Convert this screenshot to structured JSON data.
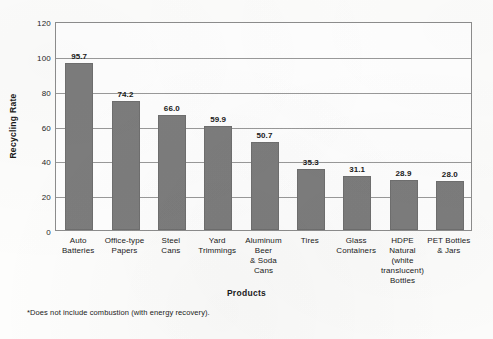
{
  "chart_data": {
    "type": "bar",
    "title": "",
    "xlabel": "Products",
    "ylabel": "Recycling Rate",
    "ylim": [
      0,
      120
    ],
    "yticks": [
      0,
      20,
      40,
      60,
      80,
      100,
      120
    ],
    "grid": true,
    "legend": false,
    "orientation": "vertical",
    "bar_color": "#7d7d7d",
    "categories": [
      "Auto Batteries",
      "Office-type Papers",
      "Steel Cans",
      "Yard Trimmings",
      "Aluminum Beer & Soda Cans",
      "Tires",
      "Glass Containers",
      "HDPE Natural (white translucent) Bottles",
      "PET Bottles & Jars"
    ],
    "category_lines": [
      [
        "Auto",
        "Batteries"
      ],
      [
        "Office-type",
        "Papers"
      ],
      [
        "Steel",
        "Cans"
      ],
      [
        "Yard",
        "Trimmings"
      ],
      [
        "Aluminum Beer",
        "& Soda Cans"
      ],
      [
        "Tires"
      ],
      [
        "Glass",
        "Containers"
      ],
      [
        "HDPE Natural",
        "(white",
        "translucent)",
        "Bottles"
      ],
      [
        "PET Bottles",
        "& Jars"
      ]
    ],
    "values": [
      95.7,
      74.2,
      66.0,
      59.9,
      50.7,
      35.3,
      31.1,
      28.9,
      28.0
    ],
    "value_labels": [
      "95.7",
      "74.2",
      "66.0",
      "59.9",
      "50.7",
      "35.3",
      "31.1",
      "28.9",
      "28.0"
    ],
    "ytick_labels": [
      "0",
      "20",
      "40",
      "60",
      "80",
      "100",
      "120"
    ],
    "footnote": "*Does not include combustion (with energy recovery)."
  }
}
